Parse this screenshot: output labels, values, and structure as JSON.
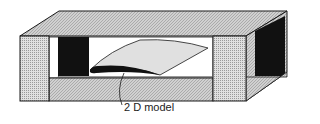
{
  "figure": {
    "label": "2 D model",
    "colors": {
      "ink": "#1a1a1a",
      "hatch": "#b8b8b8",
      "light": "#d6d6d6",
      "white": "#ffffff"
    }
  }
}
